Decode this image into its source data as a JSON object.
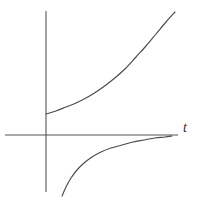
{
  "figure": {
    "width": 206,
    "height": 206,
    "background_color": "#ffffff",
    "line_color": "#4a4a4a",
    "axis_color": "#555555"
  },
  "labels": {
    "t_axis": "t"
  },
  "chart_data": {
    "type": "line",
    "title": "",
    "subtitle": "",
    "xlabel": "t",
    "ylabel": "",
    "grid": false,
    "legend": null,
    "axes": {
      "x_axis": {
        "pixel_y": 135,
        "pixel_x_start": 5,
        "pixel_x_end": 178,
        "tick_labels": []
      },
      "y_axis": {
        "pixel_x": 46,
        "pixel_y_start": 11,
        "pixel_y_end": 192,
        "tick_labels": []
      },
      "xlim": [
        -1.2,
        9.0
      ],
      "ylim": [
        -5.0,
        7.5
      ]
    },
    "series": [
      {
        "name": "upper-branch",
        "points_px": [
          [
            46,
            114
          ],
          [
            56,
            111
          ],
          [
            66,
            107
          ],
          [
            76,
            103
          ],
          [
            86,
            98
          ],
          [
            96,
            92
          ],
          [
            106,
            85
          ],
          [
            116,
            77
          ],
          [
            126,
            68
          ],
          [
            136,
            57
          ],
          [
            146,
            46
          ],
          [
            156,
            34
          ],
          [
            166,
            22
          ],
          [
            175,
            12
          ]
        ]
      },
      {
        "name": "lower-branch",
        "points_px": [
          [
            62,
            196
          ],
          [
            66,
            187
          ],
          [
            71,
            178
          ],
          [
            77,
            170
          ],
          [
            84,
            163
          ],
          [
            92,
            157
          ],
          [
            101,
            152
          ],
          [
            111,
            148
          ],
          [
            122,
            145
          ],
          [
            133,
            142
          ],
          [
            144,
            140
          ],
          [
            155,
            138
          ],
          [
            165,
            137
          ],
          [
            172,
            136
          ]
        ]
      }
    ]
  }
}
